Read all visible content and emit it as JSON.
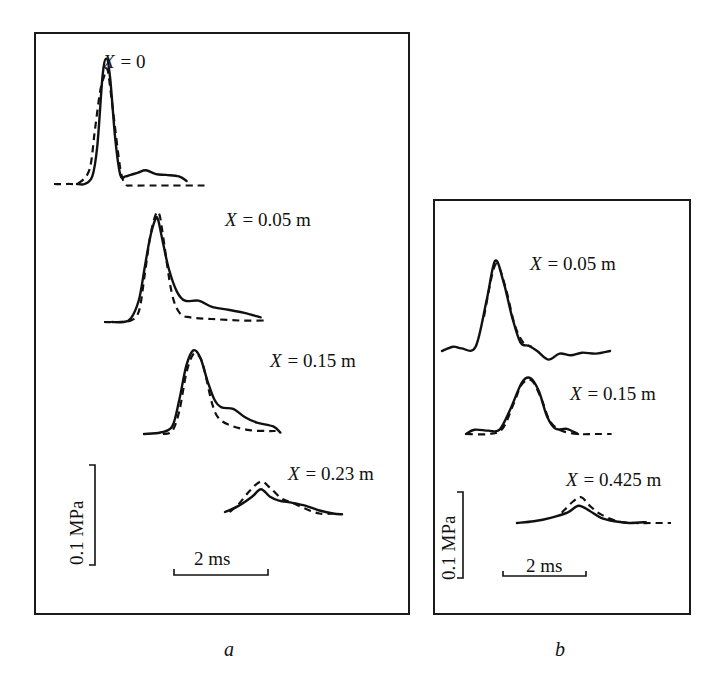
{
  "chart_data": [
    {
      "type": "line",
      "panel_label": "a",
      "title": "",
      "xlabel": "",
      "ylabel": "",
      "time_scale_bar": "2 ms",
      "pressure_scale_bar": "0.1 MPa",
      "legend": {
        "solid": "measured",
        "dashed": "calculated"
      },
      "traces": [
        {
          "label": "X = 0",
          "var": "X",
          "value": "= 0",
          "solid": {
            "t_ms": [
              0.9,
              1.2,
              1.5,
              1.7,
              1.9,
              2.05,
              2.2,
              2.4,
              2.6,
              2.8,
              3.0,
              3.3,
              3.6,
              4.0,
              4.4,
              4.9,
              5.2
            ],
            "p_MPa": [
              0.0,
              0.0,
              0.01,
              0.05,
              0.14,
              0.165,
              0.14,
              0.06,
              0.012,
              0.01,
              0.012,
              0.015,
              0.018,
              0.013,
              0.012,
              0.01,
              0.004
            ]
          },
          "dashed": {
            "t_ms": [
              0.0,
              0.5,
              1.0,
              1.4,
              1.6,
              1.8,
              1.95,
              2.1,
              2.3,
              2.6,
              2.8,
              3.0,
              3.5,
              4.5,
              5.9
            ],
            "p_MPa": [
              0.0,
              0.0,
              0.002,
              0.02,
              0.07,
              0.12,
              0.14,
              0.15,
              0.1,
              0.02,
              0.0,
              -0.002,
              -0.002,
              -0.002,
              -0.002
            ]
          }
        },
        {
          "label": "X = 0.05 m",
          "var": "X",
          "value": "= 0.05 m",
          "solid": {
            "t_ms": [
              0.3,
              0.7,
              1.0,
              1.3,
              1.5,
              1.7,
              1.9,
              2.0,
              2.15,
              2.4,
              2.7,
              3.0,
              3.5,
              4.0,
              4.6,
              5.2,
              5.8
            ],
            "p_MPa": [
              0.0,
              0.0,
              0.005,
              0.03,
              0.07,
              0.11,
              0.135,
              0.135,
              0.11,
              0.07,
              0.04,
              0.028,
              0.028,
              0.02,
              0.016,
              0.012,
              0.006
            ]
          },
          "dashed": {
            "t_ms": [
              0.0,
              0.5,
              1.0,
              1.3,
              1.5,
              1.7,
              1.9,
              2.05,
              2.2,
              2.5,
              2.8,
              3.2,
              4.0,
              5.0,
              6.0
            ],
            "p_MPa": [
              0.0,
              0.0,
              0.002,
              0.015,
              0.06,
              0.11,
              0.14,
              0.142,
              0.11,
              0.04,
              0.012,
              0.006,
              0.004,
              0.002,
              0.002
            ]
          }
        },
        {
          "label": "X = 0.15 m",
          "var": "X",
          "value": "= 0.15 m",
          "solid": {
            "t_ms": [
              0.0,
              0.7,
              1.2,
              1.5,
              1.8,
              2.1,
              2.4,
              2.7,
              3.0,
              3.3,
              3.8,
              4.3,
              4.8,
              5.5,
              5.8
            ],
            "p_MPa": [
              0.0,
              0.002,
              0.01,
              0.045,
              0.09,
              0.11,
              0.1,
              0.07,
              0.045,
              0.035,
              0.033,
              0.022,
              0.015,
              0.01,
              0.002
            ]
          },
          "dashed": {
            "t_ms": [
              0.8,
              1.2,
              1.5,
              1.8,
              2.1,
              2.4,
              2.6,
              2.9,
              3.2,
              3.8,
              4.5,
              5.2,
              5.6
            ],
            "p_MPa": [
              0.0,
              0.004,
              0.03,
              0.08,
              0.105,
              0.1,
              0.08,
              0.04,
              0.02,
              0.01,
              0.005,
              0.004,
              0.004
            ]
          }
        },
        {
          "label": "X = 0.23 m",
          "var": "X",
          "value": "= 0.23 m",
          "solid": {
            "t_ms": [
              0.0,
              0.6,
              1.2,
              1.6,
              2.0,
              2.4,
              3.0,
              3.6,
              4.2,
              4.8,
              5.2
            ],
            "p_MPa": [
              0.0,
              0.008,
              0.02,
              0.03,
              0.02,
              0.015,
              0.012,
              0.008,
              0.002,
              -0.002,
              -0.003
            ]
          },
          "dashed": {
            "t_ms": [
              0.2,
              0.6,
              1.1,
              1.6,
              2.0,
              2.5,
              3.0,
              3.6,
              4.2,
              4.8
            ],
            "p_MPa": [
              0.0,
              0.01,
              0.028,
              0.04,
              0.032,
              0.018,
              0.012,
              0.004,
              -0.002,
              -0.002
            ]
          }
        }
      ]
    },
    {
      "type": "line",
      "panel_label": "b",
      "title": "",
      "xlabel": "",
      "ylabel": "",
      "time_scale_bar": "2 ms",
      "pressure_scale_bar": "0.1 MPa",
      "legend": {
        "solid": "measured",
        "dashed": "calculated"
      },
      "traces": [
        {
          "label": "X = 0.05 m",
          "var": "X",
          "value": "= 0.05 m",
          "solid": {
            "t_ms": [
              0.0,
              0.4,
              0.7,
              1.2,
              1.6,
              1.9,
              2.2,
              2.5,
              2.8,
              3.1,
              3.4,
              3.8,
              4.2,
              4.6,
              5.0,
              5.5,
              6.0
            ],
            "p_MPa": [
              0.0,
              0.005,
              0.003,
              0.005,
              0.06,
              0.105,
              0.08,
              0.04,
              0.01,
              0.006,
              0.0,
              -0.01,
              -0.003,
              -0.005,
              -0.002,
              -0.003,
              0.0
            ]
          },
          "dashed": {
            "t_ms": [
              1.5,
              1.8,
              2.0,
              2.3,
              2.6,
              2.9,
              3.2
            ],
            "p_MPa": [
              0.04,
              0.09,
              0.1,
              0.07,
              0.03,
              0.01,
              0.005
            ]
          }
        },
        {
          "label": "X = 0.15 m",
          "var": "X",
          "value": "= 0.15 m",
          "solid": {
            "t_ms": [
              0.0,
              0.3,
              0.8,
              1.2,
              1.6,
              2.0,
              2.3,
              2.6,
              2.9,
              3.2,
              3.6,
              4.0
            ],
            "p_MPa": [
              0.0,
              0.005,
              0.004,
              0.005,
              0.03,
              0.06,
              0.065,
              0.05,
              0.02,
              0.006,
              0.006,
              0.0
            ]
          },
          "dashed": {
            "t_ms": [
              0.0,
              0.8,
              1.3,
              1.7,
              2.0,
              2.35,
              2.7,
              3.0,
              3.4,
              4.0,
              4.6,
              5.2
            ],
            "p_MPa": [
              0.0,
              0.0,
              0.006,
              0.035,
              0.058,
              0.062,
              0.04,
              0.015,
              0.004,
              0.0,
              0.0,
              0.0
            ]
          }
        },
        {
          "label": "X = 0.425 m",
          "var": "X",
          "value": "= 0.425 m",
          "solid": {
            "t_ms": [
              0.0,
              0.6,
              1.2,
              1.8,
              2.2,
              2.6,
              3.0,
              3.5,
              4.0,
              4.6
            ],
            "p_MPa": [
              0.0,
              0.002,
              0.006,
              0.012,
              0.02,
              0.014,
              0.006,
              0.002,
              0.0,
              0.001
            ]
          },
          "dashed": {
            "t_ms": [
              1.6,
              2.0,
              2.3,
              2.6,
              3.0,
              3.6,
              4.2,
              4.8,
              5.5
            ],
            "p_MPa": [
              0.012,
              0.025,
              0.03,
              0.02,
              0.01,
              0.002,
              0.0,
              0.0,
              0.0
            ]
          }
        }
      ]
    }
  ]
}
